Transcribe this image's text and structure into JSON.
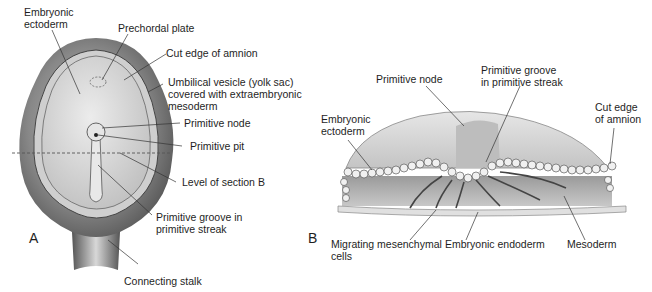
{
  "figure": {
    "panel_a": {
      "letter": "A",
      "labels": {
        "embryonic_ectoderm": "Embryonic\nectoderm",
        "prechordal_plate": "Prechordal plate",
        "cut_edge_amnion": "Cut edge of amnion",
        "umbilical_vesicle": "Umbilical vesicle (yolk sac)\ncovered with extraembryonic\nmesoderm",
        "primitive_node": "Primitive node",
        "primitive_pit": "Primitive pit",
        "level_section_b": "Level of section B",
        "primitive_groove": "Primitive groove in\nprimitive streak",
        "connecting_stalk": "Connecting stalk"
      }
    },
    "panel_b": {
      "letter": "B",
      "labels": {
        "primitive_node": "Primitive node",
        "primitive_groove": "Primitive groove\nin primitive streak",
        "embryonic_ectoderm": "Embryonic\nectoderm",
        "cut_edge_amnion": "Cut edge\nof amnion",
        "migrating_cells": "Migrating mesenchymal\ncells",
        "embryonic_endoderm": "Embryonic endoderm",
        "mesoderm": "Mesoderm"
      }
    }
  },
  "colors": {
    "yolk_sac_dark": "#5a5a5a",
    "yolk_sac_mid": "#8c8c8c",
    "embryonic_disc": "#d4d4d4",
    "amnion_light": "#e2e2e2",
    "leader_line": "#333333"
  }
}
